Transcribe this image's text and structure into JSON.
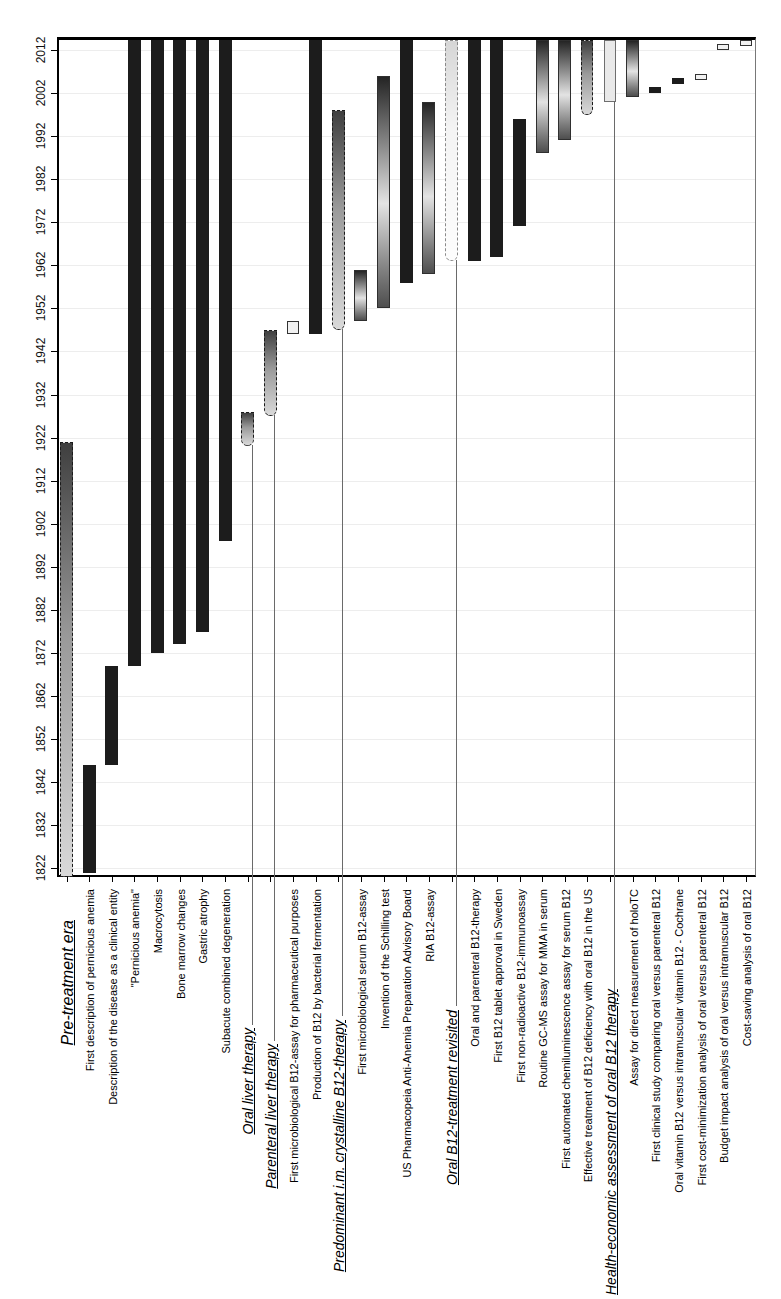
{
  "chart_data": {
    "type": "bar",
    "subtype": "floating-column-timeline (Gantt-style, rotated page: year axis vertical with most recent year at top, category labels rotated 90° below axis)",
    "title": "",
    "xlabel": "",
    "ylabel": "",
    "grid": "faint horizontal gridlines at each decade",
    "legend": "none",
    "year_axis": {
      "orientation": "vertical, 2012 near top, 1822 near bottom, labels rotated 90°",
      "frame_top_year": 2015,
      "frame_bottom_year": 1820,
      "tick_interval": 10,
      "tick_labels": [
        "2012",
        "2002",
        "1992",
        "1982",
        "1972",
        "1962",
        "1952",
        "1942",
        "1932",
        "1922",
        "1912",
        "1902",
        "1892",
        "1882",
        "1872",
        "1862",
        "1852",
        "1842",
        "1832",
        "1822"
      ],
      "tick_years": [
        2012,
        2002,
        1992,
        1982,
        1972,
        1962,
        1952,
        1942,
        1932,
        1922,
        1912,
        1902,
        1892,
        1882,
        1872,
        1862,
        1852,
        1842,
        1832,
        1822
      ]
    },
    "items": [
      {
        "label": "Pre-treatment era",
        "start": 1820,
        "end": 1921,
        "style": "era-dark",
        "heading": true,
        "label_size": 16,
        "label_top": 920,
        "leader_to": null,
        "rounded": false
      },
      {
        "label": "First description of pernicious anemia",
        "start": 1821,
        "end": 1846,
        "style": "black",
        "heading": false
      },
      {
        "label": "Description of the disease as a clinical entity",
        "start": 1846,
        "end": 1869,
        "style": "black",
        "heading": false
      },
      {
        "label": "\"Pernicious anemia\"",
        "start": 1869,
        "end": 2015,
        "style": "black",
        "heading": false
      },
      {
        "label": "Macrocytosis",
        "start": 1872,
        "end": 2015,
        "style": "black",
        "heading": false
      },
      {
        "label": "Bone marrow changes",
        "start": 1874,
        "end": 2015,
        "style": "black",
        "heading": false
      },
      {
        "label": "Gastric atrophy",
        "start": 1877,
        "end": 2015,
        "style": "black",
        "heading": false
      },
      {
        "label": "Subacute combined degeneration",
        "start": 1898,
        "end": 2015,
        "style": "black",
        "heading": false
      },
      {
        "label": "Oral liver therapy",
        "start": 1920,
        "end": 1928,
        "style": "era-dark",
        "heading": true,
        "label_size": 14,
        "label_top": 1028,
        "leader_to": 1025,
        "rounded": true
      },
      {
        "label": "Parenteral liver therapy",
        "start": 1927,
        "end": 1947,
        "style": "era-dark",
        "heading": true,
        "label_size": 14,
        "label_top": 1044,
        "leader_to": 1041,
        "rounded": true
      },
      {
        "label": "First microbiological B12-assay for pharmaceutical purposes",
        "start": 1946,
        "end": 1949,
        "style": "pale",
        "heading": false,
        "w": 12
      },
      {
        "label": "Production of B12 by bacterial fermentation",
        "start": 1946,
        "end": 2015,
        "style": "black",
        "heading": false
      },
      {
        "label": "Predominant i.m. crystalline B12-therapy",
        "start": 1947,
        "end": 1998,
        "style": "era-dark",
        "heading": true,
        "label_size": 14,
        "label_top": 1020,
        "leader_to": 1016,
        "rounded": true
      },
      {
        "label": "First microbiological serum B12-assay",
        "start": 1949,
        "end": 1961,
        "style": "grad",
        "heading": false
      },
      {
        "label": "Invention of the Schilling test",
        "start": 1952,
        "end": 2006,
        "style": "grad",
        "heading": false
      },
      {
        "label": "US Pharmacopeia Anti-Anemia Preparation Advisory Board",
        "start": 1958,
        "end": 2015,
        "style": "black",
        "heading": false
      },
      {
        "label": "RIA B12-assay",
        "start": 1960,
        "end": 2000,
        "style": "grad",
        "heading": false
      },
      {
        "label": "Oral B12-treatment revisited",
        "start": 1963,
        "end": 2015,
        "style": "era-light",
        "heading": true,
        "label_size": 14,
        "label_top": 1010,
        "leader_to": 1006,
        "rounded": true
      },
      {
        "label": "Oral and parenteral B12-therapy",
        "start": 1963,
        "end": 2015,
        "style": "black",
        "heading": false
      },
      {
        "label": "First B12 tablet approval in Sweden",
        "start": 1964,
        "end": 2015,
        "style": "black",
        "heading": false
      },
      {
        "label": "First non-radioactive B12-immunoassay",
        "start": 1971,
        "end": 1996,
        "style": "black",
        "heading": false
      },
      {
        "label": "Routine GC-MS assay for MMA in serum",
        "start": 1988,
        "end": 2015,
        "style": "grad",
        "heading": false
      },
      {
        "label": "First automated chemiluminescence assay for serum B12",
        "start": 1991,
        "end": 2015,
        "style": "grad",
        "heading": false
      },
      {
        "label": "Effective treatment of B12 deficiency with oral B12 in the US",
        "start": 1997,
        "end": 2015,
        "style": "era-dark",
        "heading": false,
        "rounded": true,
        "w": 12
      },
      {
        "label": "Health-economic assessment  of oral B12 therapy",
        "start": 2000,
        "end": 2015,
        "style": "pale-solid",
        "heading": true,
        "label_size": 14,
        "label_top": 1010,
        "leader_to": 1006,
        "w": 12
      },
      {
        "label": "Assay for direct measurement of holoTC",
        "start": 2001,
        "end": 2015,
        "style": "grad",
        "heading": false
      },
      {
        "label": "First clinical study comparing oral versus parenteral B12",
        "start": 2002,
        "end": 2003.5,
        "style": "black",
        "heading": false,
        "w": 12
      },
      {
        "label": "Oral vitamin B12 versus intramuscular vitamin B12 - Cochrane",
        "start": 2004,
        "end": 2005.5,
        "style": "black",
        "heading": false,
        "w": 12
      },
      {
        "label": "First cost-minimization analysis of oral versus parenteral B12",
        "start": 2005,
        "end": 2006.5,
        "style": "pale",
        "heading": false,
        "w": 12
      },
      {
        "label": "Budget impact analysis of oral versus intramuscular B12",
        "start": 2012,
        "end": 2013.5,
        "style": "pale",
        "heading": false,
        "w": 12
      },
      {
        "label": "Cost-saving analysis of oral B12",
        "start": 2013,
        "end": 2015,
        "style": "pale",
        "heading": false,
        "w": 12
      }
    ],
    "colors": {
      "bar_black": "#1c1c1c",
      "era_gradient_top": "#3f3f3f",
      "era_gradient_bottom": "#d9d9d9",
      "pale_fill": "#f1f1f1",
      "frame": "#000000",
      "leader_line": "#6a6a6a",
      "gridline": "#ededed",
      "background": "#ffffff"
    },
    "layout": {
      "frame": {
        "left": 57,
        "top": 37,
        "width": 699,
        "height": 840
      },
      "first_column_center_x": 66.5,
      "column_spacing": 22.65,
      "default_bar_width": 13,
      "label_bottom_anchor": 1295,
      "regular_label_top": 889,
      "ytick_label_center_x": 41
    }
  }
}
